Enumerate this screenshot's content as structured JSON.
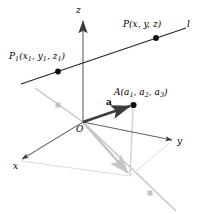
{
  "figure": {
    "background": "#ffffff",
    "width": 198,
    "height": 214
  },
  "colors": {
    "axis_dark": "#3a3a3a",
    "axis_light": "#b9b9b9",
    "line_black": "#262626",
    "vector_dark": "#3d3d3d",
    "projection_gray": "#c6c6c6",
    "marker_black": "#111111",
    "marker_gray": "#c2c2c2",
    "text": "#000000"
  },
  "axes": [
    {
      "id": "z",
      "label": "z",
      "direction": "up"
    },
    {
      "id": "y",
      "label": "y",
      "direction": "right"
    },
    {
      "id": "x",
      "label": "x",
      "direction": "down-left"
    }
  ],
  "origin": {
    "label": "O"
  },
  "points": [
    {
      "id": "P",
      "name": "P",
      "coords": [
        "x",
        "y",
        "z"
      ],
      "label_plain": "P(x, y, z)",
      "marker": "filled-dot"
    },
    {
      "id": "P1",
      "name": "P",
      "name_sub": "1",
      "coords": [
        "x₁",
        "y₁",
        "z₁"
      ],
      "label_plain": "P₁(x₁, y₁, z₁)",
      "marker": "filled-dot"
    },
    {
      "id": "A",
      "name": "A",
      "coords": [
        "a₁",
        "a₂",
        "a₃"
      ],
      "label_plain": "A(a₁, a₂, a₃)",
      "marker": "filled-dot"
    }
  ],
  "line": {
    "id": "l",
    "label": "l",
    "description": "line through P1 and P"
  },
  "vector": {
    "id": "a",
    "label": "a",
    "description": "position vector from O to A",
    "style": "bold"
  },
  "label_parts": {
    "P_main": "P",
    "P_open": "(",
    "P_x": "x",
    "P_c1": ", ",
    "P_y": "y",
    "P_c2": ", ",
    "P_z": "z",
    "P_close": ")",
    "P1_main": "P",
    "P1_sub": "1",
    "P1_open": "(",
    "P1_x": "x",
    "P1_xs": "1",
    "P1_c1": ", ",
    "P1_y": "y",
    "P1_ys": "1",
    "P1_c2": ", ",
    "P1_z": "z",
    "P1_zs": "1",
    "P1_close": ")",
    "A_main": "A",
    "A_open": "(",
    "A_a1": "a",
    "A_a1s": "1",
    "A_c1": ", ",
    "A_a2": "a",
    "A_a2s": "2",
    "A_c2": ", ",
    "A_a3": "a",
    "A_a3s": "3",
    "A_close": ")",
    "axis_z": "z",
    "axis_y": "y",
    "axis_x": "x",
    "origin": "O",
    "line_l": "l",
    "vector_a": "a"
  }
}
